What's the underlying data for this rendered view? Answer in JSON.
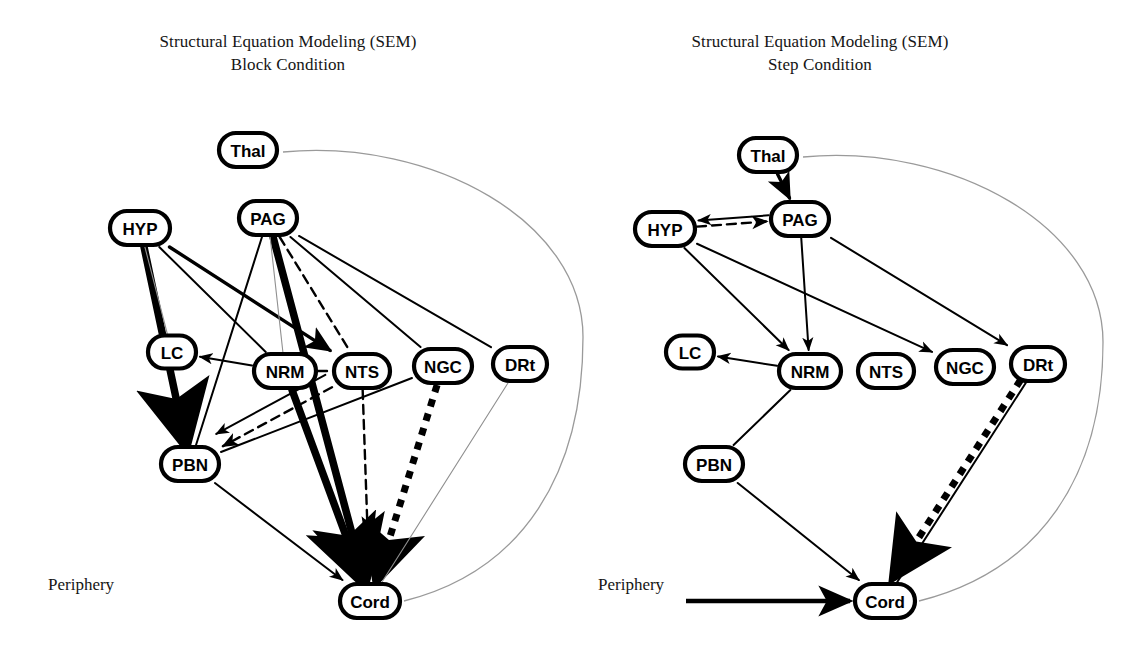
{
  "figure": {
    "width": 1135,
    "height": 648,
    "background": "#ffffff",
    "ink_color": "#000000",
    "outline_color": "#9a9a9a"
  },
  "panels": [
    {
      "id": "block",
      "title_line1": "Structural Equation Modeling (SEM)",
      "title_line2": "Block Condition",
      "title_x": 288,
      "title_y": 30,
      "periphery_label": "Periphery",
      "periphery_x": 48,
      "periphery_y": 575,
      "periphery_has_arrow": false,
      "nodes": [
        {
          "id": "Thal",
          "label": "Thal",
          "x": 248,
          "y": 150,
          "w": 58,
          "h": 34
        },
        {
          "id": "HYP",
          "label": "HYP",
          "x": 140,
          "y": 228,
          "w": 60,
          "h": 34
        },
        {
          "id": "PAG",
          "label": "PAG",
          "x": 268,
          "y": 218,
          "w": 58,
          "h": 34
        },
        {
          "id": "LC",
          "label": "LC",
          "x": 172,
          "y": 352,
          "w": 48,
          "h": 33
        },
        {
          "id": "NRM",
          "label": "NRM",
          "x": 285,
          "y": 371,
          "w": 62,
          "h": 34
        },
        {
          "id": "NTS",
          "label": "NTS",
          "x": 362,
          "y": 371,
          "w": 56,
          "h": 34
        },
        {
          "id": "NGC",
          "label": "NGC",
          "x": 443,
          "y": 366,
          "w": 58,
          "h": 34
        },
        {
          "id": "DRt",
          "label": "DRt",
          "x": 520,
          "y": 364,
          "w": 54,
          "h": 34
        },
        {
          "id": "PBN",
          "label": "PBN",
          "x": 190,
          "y": 464,
          "w": 58,
          "h": 34
        },
        {
          "id": "Cord",
          "label": "Cord",
          "x": 370,
          "y": 601,
          "w": 60,
          "h": 34
        }
      ],
      "edges": [
        {
          "from": "HYP",
          "to": "PBN",
          "style": "thick",
          "arrow": true,
          "note": "HYP to PBN heavy"
        },
        {
          "from": "HYP",
          "to": "NTS",
          "style": "medium",
          "arrow": true
        },
        {
          "from": "HYP",
          "to": "NRM",
          "style": "thin",
          "arrow": false
        },
        {
          "from": "HYP",
          "to": "LC",
          "style": "hair",
          "arrow": false
        },
        {
          "from": "PAG",
          "to": "Cord",
          "style": "thick",
          "arrow": true
        },
        {
          "from": "PAG",
          "to": "NRM",
          "style": "hair",
          "arrow": false
        },
        {
          "from": "PAG",
          "to": "NTS",
          "style": "dashed",
          "arrow": false
        },
        {
          "from": "PAG",
          "to": "NGC",
          "style": "thin",
          "arrow": false
        },
        {
          "from": "PAG",
          "to": "DRt",
          "style": "thin",
          "arrow": false
        },
        {
          "from": "PAG",
          "to": "PBN",
          "style": "thin",
          "arrow": false
        },
        {
          "from": "NRM",
          "to": "LC",
          "style": "thin",
          "arrow": true
        },
        {
          "from": "NRM",
          "to": "Cord",
          "style": "thick",
          "arrow": true
        },
        {
          "from": "NRM",
          "to": "NTS",
          "style": "dashed",
          "arrow": false
        },
        {
          "from": "NTS",
          "to": "PBN",
          "style": "dashed",
          "arrow": true
        },
        {
          "from": "NTS",
          "to": "Cord",
          "style": "dashed",
          "arrow": true
        },
        {
          "from": "NTS",
          "to": "PBN2",
          "style": "thin",
          "arrow": true
        },
        {
          "from": "NGC",
          "to": "Cord",
          "style": "dotted",
          "arrow": true
        },
        {
          "from": "NGC",
          "to": "PBN",
          "style": "thin",
          "arrow": false
        },
        {
          "from": "PBN",
          "to": "Cord",
          "style": "thin",
          "arrow": true
        },
        {
          "from": "DRt",
          "to": "Cord",
          "style": "hair",
          "arrow": false
        }
      ]
    },
    {
      "id": "step",
      "title_line1": "Structural Equation Modeling (SEM)",
      "title_line2": "Step Condition",
      "title_x": 820,
      "title_y": 30,
      "periphery_label": "Periphery",
      "periphery_x": 598,
      "periphery_y": 575,
      "periphery_has_arrow": true,
      "nodes": [
        {
          "id": "Thal",
          "label": "Thal",
          "x": 768,
          "y": 155,
          "w": 58,
          "h": 34
        },
        {
          "id": "HYP",
          "label": "HYP",
          "x": 665,
          "y": 229,
          "w": 60,
          "h": 34
        },
        {
          "id": "PAG",
          "label": "PAG",
          "x": 800,
          "y": 219,
          "w": 58,
          "h": 34
        },
        {
          "id": "LC",
          "label": "LC",
          "x": 690,
          "y": 352,
          "w": 48,
          "h": 33
        },
        {
          "id": "NRM",
          "label": "NRM",
          "x": 810,
          "y": 371,
          "w": 62,
          "h": 34
        },
        {
          "id": "NTS",
          "label": "NTS",
          "x": 886,
          "y": 371,
          "w": 56,
          "h": 34
        },
        {
          "id": "NGC",
          "label": "NGC",
          "x": 965,
          "y": 367,
          "w": 58,
          "h": 34
        },
        {
          "id": "DRt",
          "label": "DRt",
          "x": 1038,
          "y": 364,
          "w": 54,
          "h": 34
        },
        {
          "id": "PBN",
          "label": "PBN",
          "x": 714,
          "y": 464,
          "w": 58,
          "h": 34
        },
        {
          "id": "Cord",
          "label": "Cord",
          "x": 885,
          "y": 601,
          "w": 60,
          "h": 34
        }
      ],
      "edges": [
        {
          "from": "Thal",
          "to": "PAG",
          "style": "medium",
          "arrow": true
        },
        {
          "from": "HYP",
          "to": "PAG",
          "style": "dashed",
          "arrow": true
        },
        {
          "from": "PAG",
          "to": "HYP",
          "style": "thin",
          "arrow": true
        },
        {
          "from": "PAG",
          "to": "NRM",
          "style": "thin",
          "arrow": true
        },
        {
          "from": "PAG",
          "to": "DRt",
          "style": "thin",
          "arrow": true
        },
        {
          "from": "HYP",
          "to": "NRM",
          "style": "thin",
          "arrow": true
        },
        {
          "from": "HYP",
          "to": "NGC",
          "style": "thin",
          "arrow": true
        },
        {
          "from": "NRM",
          "to": "LC",
          "style": "thin",
          "arrow": true
        },
        {
          "from": "NRM",
          "to": "PBN",
          "style": "thin",
          "arrow": false
        },
        {
          "from": "PBN",
          "to": "Cord",
          "style": "thin",
          "arrow": true
        },
        {
          "from": "DRt",
          "to": "Cord",
          "style": "thin",
          "arrow": false
        },
        {
          "from": "DRt",
          "to": "Cord",
          "style": "dotted",
          "arrow": true
        }
      ]
    }
  ],
  "legend_styles": {
    "hair": "very thin grey solid line",
    "thin": "thin black solid line with arrowhead",
    "medium": "medium black solid line",
    "thick": "heavy black solid line",
    "dashed": "black dashed line",
    "dotted": "heavy black square-dotted line"
  }
}
